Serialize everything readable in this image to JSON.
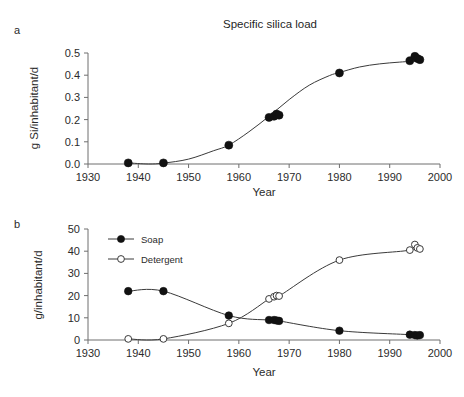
{
  "figure": {
    "panel_a_label": "a",
    "panel_b_label": "b"
  },
  "chart_data": [
    {
      "id": "panel-a",
      "type": "scatter",
      "title": "Specific silica load",
      "xlabel": "Year",
      "ylabel": "g Si/inhabitant/d",
      "xlim": [
        1930,
        2000
      ],
      "ylim": [
        0.0,
        0.5
      ],
      "xticks": [
        1930,
        1940,
        1950,
        1960,
        1970,
        1980,
        1990,
        2000
      ],
      "xtick_labels": [
        "1930",
        "1940",
        "1950",
        "1960",
        "1970",
        "1980",
        "1990",
        "2000"
      ],
      "yticks": [
        0.0,
        0.1,
        0.2,
        0.3,
        0.4,
        0.5
      ],
      "ytick_labels": [
        "0.0",
        "0.1",
        "0.2",
        "0.3",
        "0.4",
        "0.5"
      ],
      "grid": false,
      "legend": "none",
      "series": [
        {
          "name": "Specific silica load",
          "marker": "filled-circle",
          "line": "smooth-fit",
          "x": [
            1938,
            1945,
            1958,
            1966,
            1967,
            1967.5,
            1968,
            1980,
            1994,
            1995,
            1995.5,
            1996
          ],
          "y": [
            0.005,
            0.005,
            0.085,
            0.21,
            0.215,
            0.225,
            0.22,
            0.41,
            0.465,
            0.485,
            0.475,
            0.47
          ]
        }
      ],
      "fit_curve": {
        "x": [
          1938,
          1942,
          1945,
          1950,
          1955,
          1958,
          1962,
          1966,
          1970,
          1974,
          1978,
          1980,
          1984,
          1988,
          1992,
          1996
        ],
        "y": [
          0.005,
          0.0,
          0.004,
          0.022,
          0.06,
          0.085,
          0.145,
          0.215,
          0.29,
          0.355,
          0.398,
          0.412,
          0.437,
          0.451,
          0.459,
          0.465
        ]
      }
    },
    {
      "id": "panel-b",
      "type": "line",
      "title": "",
      "xlabel": "Year",
      "ylabel": "g/inhabitant/d",
      "xlim": [
        1930,
        2000
      ],
      "ylim": [
        0,
        50
      ],
      "xticks": [
        1930,
        1940,
        1950,
        1960,
        1970,
        1980,
        1990,
        2000
      ],
      "xtick_labels": [
        "1930",
        "1940",
        "1950",
        "1960",
        "1970",
        "1980",
        "1990",
        "2000"
      ],
      "yticks": [
        0,
        10,
        20,
        30,
        40,
        50
      ],
      "ytick_labels": [
        "0",
        "10",
        "20",
        "30",
        "40",
        "50"
      ],
      "grid": false,
      "legend": "inside-top-left",
      "series": [
        {
          "name": "Soap",
          "marker": "filled-circle",
          "x": [
            1938,
            1945,
            1958,
            1966,
            1967,
            1967.5,
            1968,
            1980,
            1994,
            1995,
            1995.5,
            1996
          ],
          "y": [
            22,
            22,
            11,
            9,
            9,
            8.8,
            8.6,
            4.2,
            2.4,
            2.2,
            2.0,
            2.2
          ]
        },
        {
          "name": "Detergent",
          "marker": "open-circle",
          "x": [
            1938,
            1945,
            1958,
            1966,
            1967,
            1967.5,
            1968,
            1980,
            1994,
            1995,
            1995.5,
            1996
          ],
          "y": [
            0.5,
            0.5,
            7.5,
            18.5,
            19.5,
            20,
            19.8,
            36,
            40.5,
            43,
            41.5,
            41
          ]
        }
      ]
    }
  ]
}
